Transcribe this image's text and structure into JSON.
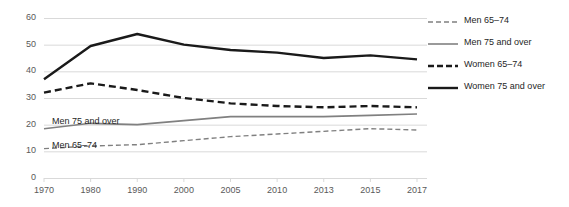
{
  "chart_data": {
    "type": "line",
    "title": "",
    "subtitle": "",
    "xlabel": "",
    "ylabel": "",
    "categories": [
      "1970",
      "1980",
      "1990",
      "2000",
      "2005",
      "2010",
      "2013",
      "2015",
      "2017"
    ],
    "x": [
      "1970",
      "1980",
      "1990",
      "2000",
      "2005",
      "2010",
      "2013",
      "2015",
      "2017"
    ],
    "ylim": [
      0,
      60
    ],
    "yticks": [
      0,
      10,
      20,
      30,
      40,
      50,
      60
    ],
    "ytick_labels": [
      "0",
      "10",
      "20",
      "30",
      "40",
      "50",
      "60"
    ],
    "grid": "horizontal",
    "legend_position": "right",
    "series": [
      {
        "name": "Men 65–74",
        "style": "dashed",
        "color": "#808080",
        "width": 1.4,
        "values": [
          11,
          12,
          12.5,
          14,
          15.5,
          16.5,
          17.5,
          18.5,
          18
        ]
      },
      {
        "name": "Men 75 and over",
        "style": "solid",
        "color": "#808080",
        "width": 1.6,
        "values": [
          18.5,
          20.5,
          20,
          21.5,
          23,
          23,
          23,
          23.5,
          24
        ]
      },
      {
        "name": "Women 65–74",
        "style": "dashed",
        "color": "#1a1a1a",
        "width": 2.4,
        "values": [
          32,
          35.5,
          33,
          30,
          28,
          27,
          26.5,
          27,
          26.5
        ]
      },
      {
        "name": "Women 75 and over",
        "style": "solid",
        "color": "#1a1a1a",
        "width": 2.4,
        "values": [
          37,
          49.5,
          54,
          50,
          48,
          47,
          45,
          46,
          44.5
        ]
      }
    ],
    "annotations": [
      {
        "text": "Men 75 and over",
        "x_px": 52,
        "y_px": 117
      },
      {
        "text": "Men 65–74",
        "x_px": 52,
        "y_px": 141
      }
    ],
    "colors": {
      "grid": "#d9d9d9",
      "axis_text": "#595959",
      "dark_series": "#1a1a1a",
      "light_series": "#808080",
      "background": "#ffffff"
    }
  },
  "legend": {
    "items": [
      {
        "label": "Men 65–74"
      },
      {
        "label": "Men 75 and over"
      },
      {
        "label": "Women 65–74"
      },
      {
        "label": "Women 75 and over"
      }
    ]
  }
}
